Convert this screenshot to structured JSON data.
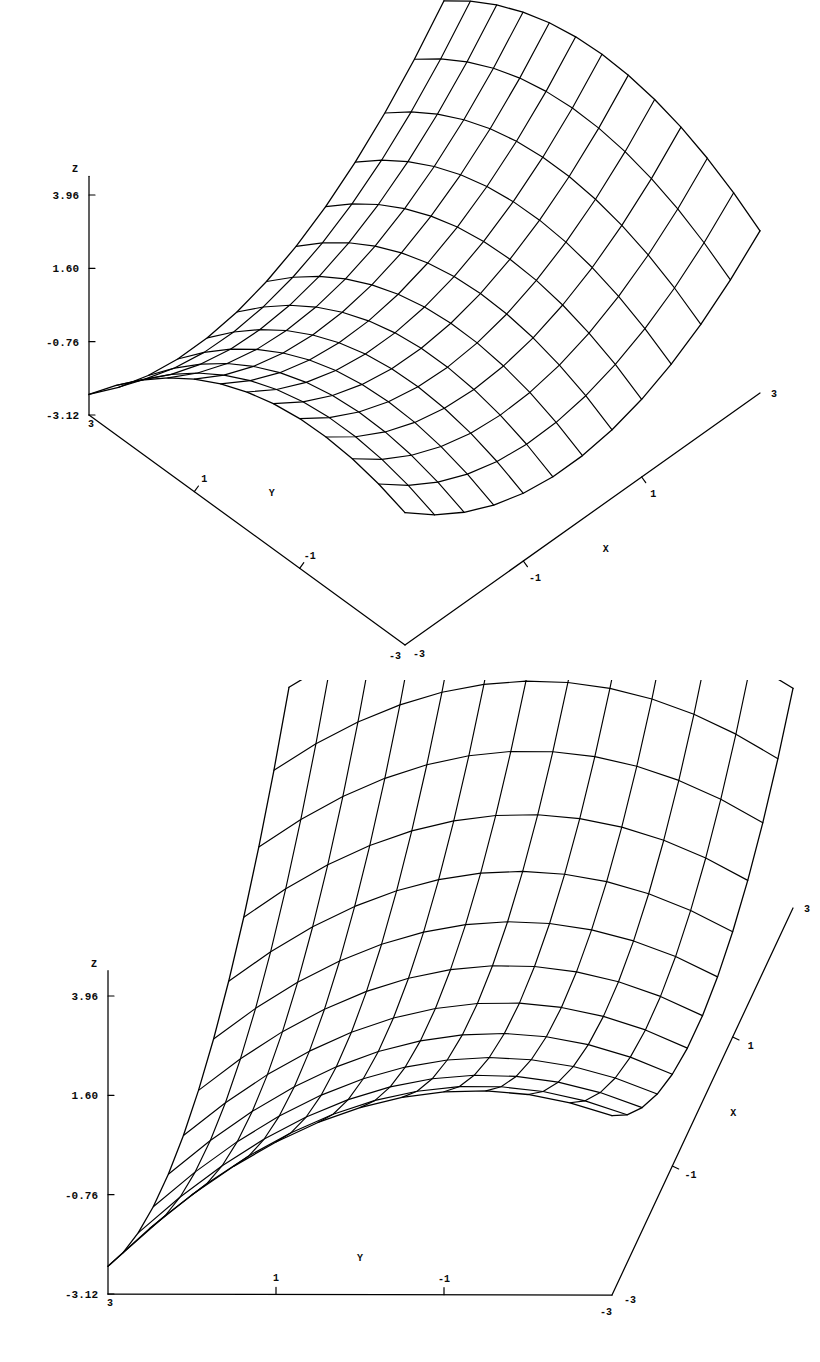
{
  "figure": {
    "kind": "two-panel-3d-surface-wireframe",
    "background_color": "#ffffff",
    "line_color": "#000000"
  },
  "chart_data": [
    {
      "id": "plot-top",
      "type": "surface",
      "title": "",
      "subtitle": "",
      "xlabel": "X",
      "ylabel": "Y",
      "zlabel": "Z",
      "xlim": [
        -3,
        3
      ],
      "ylim": [
        -3,
        3
      ],
      "zlim": [
        -3.12,
        3.96
      ],
      "grid": false,
      "legend": null,
      "x_ticks": [
        -3,
        -1,
        1,
        3
      ],
      "x_tick_labels": [
        "-3",
        "-1",
        "1",
        "3"
      ],
      "y_ticks": [
        -3,
        -1,
        1,
        3
      ],
      "y_tick_labels": [
        "-3",
        "-1",
        "1",
        "3"
      ],
      "z_ticks": [
        -3.12,
        -0.76,
        1.6,
        3.96
      ],
      "z_tick_labels": [
        "-3.12",
        "-0.76",
        "1.60",
        "3.96"
      ],
      "mesh_divisions_x": 12,
      "mesh_divisions_y": 12,
      "view": {
        "azimuth_deg": 52,
        "elevation_deg": 24,
        "note": "corner x=-3,y=-3 nearest viewer at bottom"
      },
      "surface_formula": "z = 0.42*x*x - 0.30*y*y + 0.62*x*y*0.0 + 0.55*x - 0.35*y",
      "z_value_grid_note": "saddle-shaped wireframe rising toward +x/+y back corner"
    },
    {
      "id": "plot-bottom",
      "type": "surface",
      "title": "",
      "subtitle": "",
      "xlabel": "X",
      "ylabel": "Y",
      "zlabel": "Z",
      "xlim": [
        -3,
        3
      ],
      "ylim": [
        -3,
        3
      ],
      "zlim": [
        -3.12,
        3.96
      ],
      "grid": false,
      "legend": null,
      "x_ticks": [
        -3,
        -1,
        1,
        3
      ],
      "x_tick_labels": [
        "-3",
        "-1",
        "1",
        "3"
      ],
      "y_ticks": [
        -3,
        -1,
        1,
        3
      ],
      "y_tick_labels": [
        "-3",
        "-1",
        "1",
        "3"
      ],
      "z_ticks": [
        -3.12,
        -0.76,
        1.6,
        3.96
      ],
      "z_tick_labels": [
        "-3.12",
        "-0.76",
        "1.60",
        "3.96"
      ],
      "mesh_divisions_x": 12,
      "mesh_divisions_y": 12,
      "view": {
        "azimuth_deg": 82,
        "elevation_deg": 16,
        "note": "near edge-on view, surface folds toward Z axis at left"
      },
      "surface_formula": "z = 0.42*x*x - 0.30*y*y + 0.55*x - 0.35*y",
      "z_value_grid_note": "same surface, rotated so Y axis is nearly horizontal"
    }
  ],
  "plots": [
    {
      "name": "plot-top",
      "z_axis": {
        "label": "Z",
        "ticks": [
          "3.96",
          "1.60",
          "-0.76",
          "-3.12"
        ]
      },
      "x_axis": {
        "label": "X",
        "ticks": [
          "-1",
          "1",
          "3"
        ],
        "origin_tick": "-3"
      },
      "y_axis": {
        "label": "Y",
        "ticks": [
          "1",
          "-1"
        ],
        "origin_tick": "3",
        "far_tick": "-3"
      }
    },
    {
      "name": "plot-bottom",
      "z_axis": {
        "label": "Z",
        "ticks": [
          "3.96",
          "1.60",
          "-0.76",
          "-3.12"
        ]
      },
      "x_axis": {
        "label": "X",
        "ticks": [
          "-1",
          "1",
          "3"
        ],
        "origin_tick": "-3"
      },
      "y_axis": {
        "label": "Y",
        "ticks": [
          "1",
          "-1"
        ],
        "origin_tick": "3",
        "far_tick": "-3"
      }
    }
  ]
}
